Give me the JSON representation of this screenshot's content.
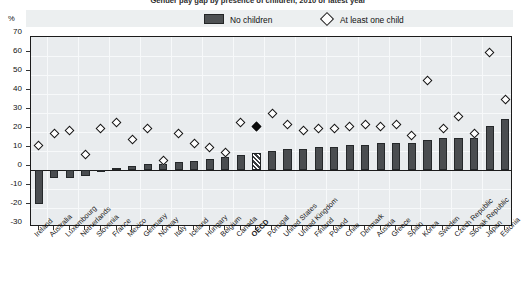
{
  "title": {
    "main": "Gender pay gap by presence of children, 2010 or latest year",
    "unit_label": "%"
  },
  "legend": {
    "no_children": "No children",
    "at_least_one_child": "At least one child"
  },
  "chart_data": {
    "type": "bar",
    "title": "Gender pay gap by presence of children, 2010 or latest year",
    "xlabel": "",
    "ylabel": "%",
    "ylim": [
      -30,
      70
    ],
    "ytick_values": [
      -30,
      -20,
      -10,
      0,
      10,
      20,
      30,
      40,
      50,
      60,
      70
    ],
    "ytick_labels": [
      "-30",
      "-20",
      "-10",
      "0",
      "10",
      "20",
      "30",
      "40",
      "50",
      "60",
      "70"
    ],
    "grid": true,
    "legend_position": "top",
    "highlight_category": "OECD",
    "categories": [
      "Ireland",
      "Australia",
      "Luxembourg",
      "Netherlands",
      "Slovenia",
      "France",
      "Mexico",
      "Germany",
      "Norway",
      "Italy",
      "Iceland",
      "Hungary",
      "Belgium",
      "Canada",
      "OECD",
      "Portugal",
      "United States",
      "United Kingdom",
      "Finland",
      "Poland",
      "Chile",
      "Denmark",
      "Austria",
      "Greece",
      "Spain",
      "Korea",
      "Sweden",
      "Czech Republic",
      "Slovak Republic",
      "Japan",
      "Estonia"
    ],
    "series": [
      {
        "name": "No children",
        "marker": "bar",
        "values": [
          -18,
          -4,
          -4,
          -3,
          0,
          1,
          2,
          3,
          3,
          4,
          5,
          6,
          7,
          8,
          9,
          10,
          11,
          11,
          12,
          12,
          13,
          13,
          14,
          14,
          14,
          16,
          17,
          17,
          17,
          23,
          27
        ]
      },
      {
        "name": "At least one child",
        "marker": "diamond",
        "values": [
          13,
          19,
          21,
          8,
          22,
          25,
          16,
          22,
          5,
          19,
          14,
          12,
          9,
          25,
          23,
          30,
          24,
          21,
          22,
          22,
          23,
          24,
          23,
          24,
          18,
          47,
          22,
          28,
          19,
          62,
          37
        ]
      }
    ]
  }
}
